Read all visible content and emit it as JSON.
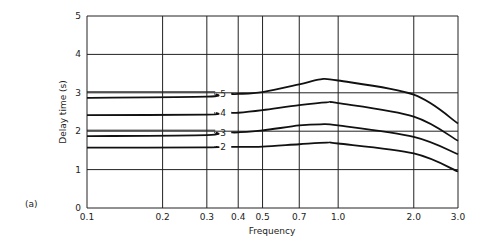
{
  "chart_data": {
    "type": "line",
    "panel_label": "(a)",
    "title": "",
    "xlabel": "Frequency",
    "ylabel": "Delay time (s)",
    "xscale": "log",
    "xlim": [
      0.1,
      3.0
    ],
    "ylim": [
      0,
      5
    ],
    "xticks": [
      0.1,
      0.2,
      0.3,
      0.4,
      0.5,
      0.7,
      1.0,
      2.0,
      3.0
    ],
    "xtick_labels": [
      "0.1",
      "0.2",
      "0.3",
      "0.4",
      "0.5",
      "0.7",
      "1.0",
      "2.0",
      "3.0"
    ],
    "yticks": [
      0,
      1,
      2,
      3,
      4,
      5
    ],
    "ytick_labels": [
      "0",
      "1",
      "2",
      "3",
      "4",
      "5"
    ],
    "grid": true,
    "reference_lines": [
      {
        "name": "ref-3",
        "y": 3.0
      },
      {
        "name": "ref-2",
        "y": 2.0
      }
    ],
    "series": [
      {
        "name": "5",
        "x": [
          0.1,
          0.3,
          0.4,
          0.5,
          0.7,
          0.85,
          1.0,
          2.0,
          3.0
        ],
        "values": [
          2.87,
          2.9,
          2.97,
          3.02,
          3.22,
          3.35,
          3.32,
          2.95,
          2.2
        ]
      },
      {
        "name": "4",
        "x": [
          0.1,
          0.3,
          0.4,
          0.5,
          0.7,
          0.9,
          1.0,
          2.0,
          3.0
        ],
        "values": [
          2.42,
          2.43,
          2.48,
          2.55,
          2.68,
          2.75,
          2.73,
          2.38,
          1.75
        ]
      },
      {
        "name": "3",
        "x": [
          0.1,
          0.3,
          0.4,
          0.5,
          0.7,
          0.85,
          1.0,
          2.0,
          3.0
        ],
        "values": [
          1.87,
          1.9,
          1.97,
          2.02,
          2.15,
          2.18,
          2.15,
          1.85,
          1.4
        ]
      },
      {
        "name": "2",
        "x": [
          0.1,
          0.3,
          0.4,
          0.5,
          0.7,
          0.9,
          1.0,
          2.0,
          3.0
        ],
        "values": [
          1.57,
          1.58,
          1.59,
          1.6,
          1.66,
          1.7,
          1.68,
          1.42,
          0.95
        ]
      }
    ],
    "curve_label_x": 0.33
  }
}
